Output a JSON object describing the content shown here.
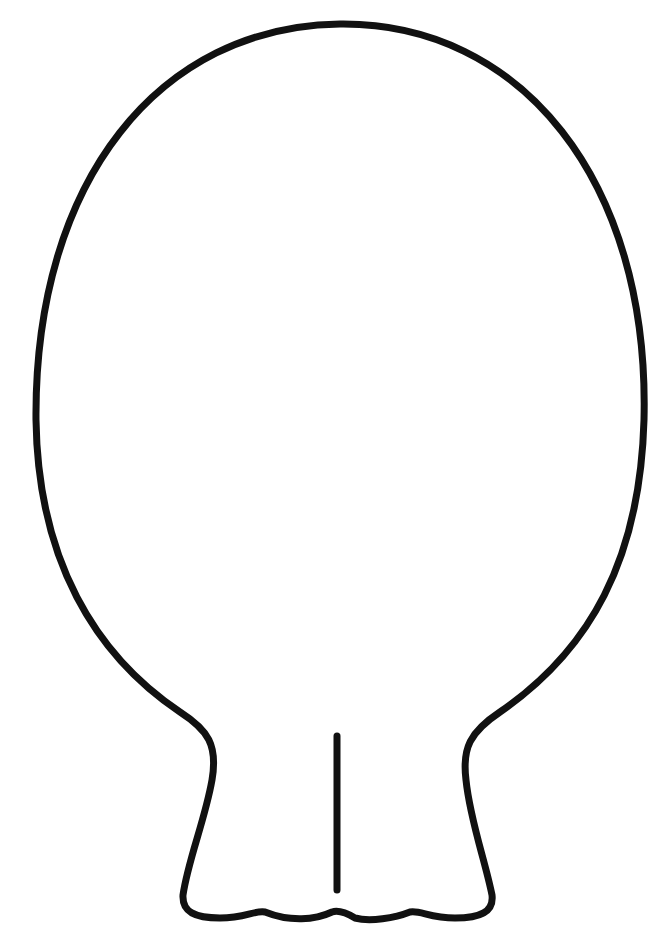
{
  "image": {
    "subject": "balloon-outline",
    "style": "coloring-page line art",
    "stroke_color": "#111111",
    "background_color": "#ffffff"
  }
}
